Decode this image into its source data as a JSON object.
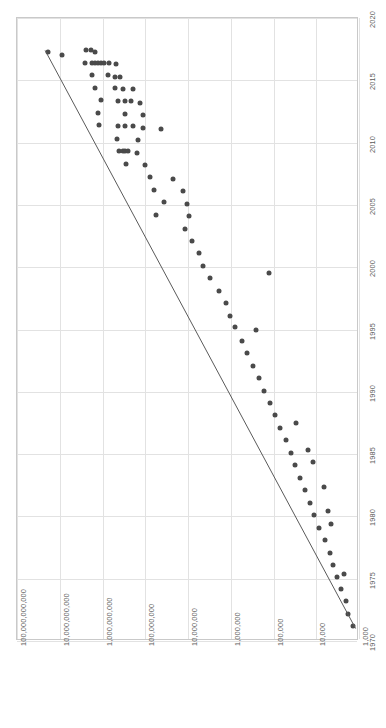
{
  "chart_data": {
    "type": "scatter",
    "title": "",
    "subtitle": "",
    "orientation": "rotated-90",
    "xlabel": "",
    "ylabel": "",
    "grid": true,
    "legend": null,
    "xaxis": {
      "name": "Year",
      "scale": "linear",
      "min": 1970,
      "max": 2020,
      "ticks": [
        1970,
        1975,
        1980,
        1985,
        1990,
        1995,
        2000,
        2005,
        2010,
        2015,
        2020
      ],
      "tick_labels": [
        "1970",
        "1975",
        "1980",
        "1985",
        "1990",
        "1995",
        "2000",
        "2005",
        "2010",
        "2015",
        "2020"
      ]
    },
    "yaxis": {
      "name": "Transistor count",
      "scale": "log10",
      "min": 1000,
      "max": 100000000000,
      "ticks": [
        1000,
        10000,
        100000,
        1000000,
        10000000,
        100000000,
        1000000000,
        10000000000,
        100000000000
      ],
      "tick_labels": [
        "1,000",
        "10,000",
        "100,000",
        "1,000,000",
        "10,000,000",
        "100,000,000",
        "1,000,000,000",
        "10,000,000,000",
        "100,000,000,000"
      ]
    },
    "series": [
      {
        "name": "Transistor count",
        "marker": "circle",
        "color": "#4a4a4a",
        "points": [
          {
            "x": 2017.3,
            "y": 19000000000
          },
          {
            "x": 2017.0,
            "y": 9000000000
          },
          {
            "x": 2017.4,
            "y": 2400000000
          },
          {
            "x": 2017.4,
            "y": 1900000000
          },
          {
            "x": 2017.3,
            "y": 1500000000
          },
          {
            "x": 2016.4,
            "y": 2500000000
          },
          {
            "x": 2016.4,
            "y": 1800000000
          },
          {
            "x": 2016.4,
            "y": 1500000000
          },
          {
            "x": 2016.4,
            "y": 1300000000
          },
          {
            "x": 2016.4,
            "y": 1100000000
          },
          {
            "x": 2016.4,
            "y": 900000000
          },
          {
            "x": 2016.4,
            "y": 700000000
          },
          {
            "x": 2016.3,
            "y": 480000000
          },
          {
            "x": 2015.4,
            "y": 1750000000
          },
          {
            "x": 2015.4,
            "y": 750000000
          },
          {
            "x": 2015.3,
            "y": 520000000
          },
          {
            "x": 2015.3,
            "y": 400000000
          },
          {
            "x": 2014.4,
            "y": 1500000000
          },
          {
            "x": 2014.4,
            "y": 520000000
          },
          {
            "x": 2014.3,
            "y": 330000000
          },
          {
            "x": 2014.3,
            "y": 190000000
          },
          {
            "x": 2013.4,
            "y": 1100000000
          },
          {
            "x": 2013.3,
            "y": 430000000
          },
          {
            "x": 2013.3,
            "y": 300000000
          },
          {
            "x": 2013.3,
            "y": 210000000
          },
          {
            "x": 2013.2,
            "y": 130000000
          },
          {
            "x": 2012.4,
            "y": 1300000000
          },
          {
            "x": 2012.3,
            "y": 290000000
          },
          {
            "x": 2012.2,
            "y": 110000000
          },
          {
            "x": 2011.4,
            "y": 1200000000
          },
          {
            "x": 2011.3,
            "y": 440000000
          },
          {
            "x": 2011.3,
            "y": 300000000
          },
          {
            "x": 2011.3,
            "y": 190000000
          },
          {
            "x": 2011.2,
            "y": 110000000
          },
          {
            "x": 2011.1,
            "y": 42000000
          },
          {
            "x": 2010.3,
            "y": 470000000
          },
          {
            "x": 2010.2,
            "y": 150000000
          },
          {
            "x": 2009.3,
            "y": 420000000
          },
          {
            "x": 2009.3,
            "y": 330000000
          },
          {
            "x": 2009.3,
            "y": 290000000
          },
          {
            "x": 2009.3,
            "y": 250000000
          },
          {
            "x": 2009.2,
            "y": 160000000
          },
          {
            "x": 2008.3,
            "y": 280000000
          },
          {
            "x": 2008.2,
            "y": 100000000
          },
          {
            "x": 2007.2,
            "y": 78000000
          },
          {
            "x": 2007.1,
            "y": 22000000
          },
          {
            "x": 2006.2,
            "y": 61000000
          },
          {
            "x": 2006.1,
            "y": 13000000
          },
          {
            "x": 2005.1,
            "y": 10500000
          },
          {
            "x": 2005.2,
            "y": 36000000
          },
          {
            "x": 2004.2,
            "y": 57000000
          },
          {
            "x": 2004.1,
            "y": 9500000
          },
          {
            "x": 2003.1,
            "y": 12000000
          },
          {
            "x": 2002.1,
            "y": 8000000
          },
          {
            "x": 2001.1,
            "y": 5500000
          },
          {
            "x": 2000.1,
            "y": 4500000
          },
          {
            "x": 1999.5,
            "y": 130000
          },
          {
            "x": 1999.1,
            "y": 3000000
          },
          {
            "x": 1998.1,
            "y": 1900000
          },
          {
            "x": 1997.1,
            "y": 1300000
          },
          {
            "x": 1996.1,
            "y": 1050000
          },
          {
            "x": 1995.2,
            "y": 800000
          },
          {
            "x": 1995.0,
            "y": 250000
          },
          {
            "x": 1994.1,
            "y": 550000
          },
          {
            "x": 1993.1,
            "y": 420000
          },
          {
            "x": 1992.1,
            "y": 300000
          },
          {
            "x": 1991.1,
            "y": 220000
          },
          {
            "x": 1990.1,
            "y": 170000
          },
          {
            "x": 1989.1,
            "y": 120000
          },
          {
            "x": 1988.1,
            "y": 90000
          },
          {
            "x": 1987.5,
            "y": 30000
          },
          {
            "x": 1987.1,
            "y": 70000
          },
          {
            "x": 1986.1,
            "y": 52000
          },
          {
            "x": 1985.3,
            "y": 16000
          },
          {
            "x": 1985.1,
            "y": 40000
          },
          {
            "x": 1984.1,
            "y": 31000
          },
          {
            "x": 1984.4,
            "y": 12000
          },
          {
            "x": 1983.1,
            "y": 24000
          },
          {
            "x": 1982.1,
            "y": 18000
          },
          {
            "x": 1982.4,
            "y": 6500
          },
          {
            "x": 1981.1,
            "y": 14000
          },
          {
            "x": 1980.1,
            "y": 11000
          },
          {
            "x": 1980.4,
            "y": 5200
          },
          {
            "x": 1979.1,
            "y": 8500
          },
          {
            "x": 1979.4,
            "y": 4400
          },
          {
            "x": 1978.1,
            "y": 6200
          },
          {
            "x": 1977.1,
            "y": 4800
          },
          {
            "x": 1976.1,
            "y": 4000
          },
          {
            "x": 1975.4,
            "y": 2300
          },
          {
            "x": 1975.1,
            "y": 3200
          },
          {
            "x": 1974.2,
            "y": 2700
          },
          {
            "x": 1973.2,
            "y": 2000
          },
          {
            "x": 1972.2,
            "y": 1800
          },
          {
            "x": 1971.2,
            "y": 1400
          }
        ]
      }
    ],
    "trendline": {
      "name": "Moore's Law fit",
      "color": "#5a5a5a",
      "from": {
        "x": 1971.0,
        "y": 1200
      },
      "to": {
        "x": 2017.4,
        "y": 22000000000
      }
    }
  }
}
